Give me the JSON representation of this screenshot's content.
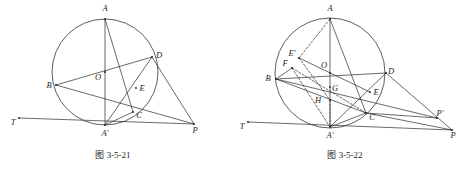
{
  "page": {
    "width": 469,
    "height": 170,
    "background": "#ffffff",
    "ink": "#2a2a2a"
  },
  "figures": [
    {
      "id": "fig-3-5-21",
      "caption": "图 3-5-21",
      "caption_pos": {
        "x": 113,
        "y": 158
      },
      "circle": {
        "cx": 105,
        "cy": 72,
        "r": 53
      },
      "points": {
        "A": {
          "x": 105,
          "y": 19,
          "label": "A",
          "lx": 105,
          "ly": 11
        },
        "B": {
          "x": 56,
          "y": 85,
          "label": "B",
          "lx": 49,
          "ly": 88
        },
        "O": {
          "x": 105,
          "y": 72,
          "label": "O",
          "lx": 98,
          "ly": 80
        },
        "D": {
          "x": 152,
          "y": 57,
          "label": "D",
          "lx": 159,
          "ly": 58
        },
        "E": {
          "x": 136,
          "y": 88,
          "label": "E",
          "lx": 142,
          "ly": 91
        },
        "C": {
          "x": 133,
          "y": 112,
          "label": "C",
          "lx": 139,
          "ly": 118
        },
        "Ap": {
          "x": 105,
          "y": 125,
          "label": "A'",
          "lx": 105,
          "ly": 136
        },
        "P": {
          "x": 194,
          "y": 124,
          "label": "P",
          "lx": 195,
          "ly": 133
        },
        "T": {
          "x": 19,
          "y": 118,
          "label": "T",
          "lx": 13,
          "ly": 125
        }
      },
      "segments": [
        {
          "name": "diameter-A-Aprime",
          "from": "A",
          "to": "Ap",
          "style": "solid"
        },
        {
          "name": "chord-B-D",
          "from": "B",
          "to": "D",
          "style": "solid"
        },
        {
          "name": "chord-A-C",
          "from": "A",
          "to": "C",
          "style": "solid"
        },
        {
          "name": "chord-Aprime-D",
          "from": "Ap",
          "to": "D",
          "style": "solid"
        },
        {
          "name": "segment-B-P",
          "from": "B",
          "to": "P",
          "style": "solid"
        },
        {
          "name": "segment-D-P",
          "from": "D",
          "to": "P",
          "style": "solid"
        },
        {
          "name": "tangent-T-P",
          "from": "T",
          "to": "P",
          "style": "solid"
        },
        {
          "name": "segment-Aprime-C",
          "from": "Ap",
          "to": "C",
          "style": "solid"
        }
      ]
    },
    {
      "id": "fig-3-5-22",
      "caption": "图 3-5-22",
      "caption_pos": {
        "x": 345,
        "y": 158
      },
      "circle": {
        "cx": 330,
        "cy": 73,
        "r": 55
      },
      "points": {
        "A": {
          "x": 330,
          "y": 19,
          "label": "A",
          "lx": 330,
          "ly": 11
        },
        "Ep": {
          "x": 299,
          "y": 58,
          "label": "E'",
          "lx": 292,
          "ly": 56
        },
        "F": {
          "x": 292,
          "y": 68,
          "label": "F",
          "lx": 285,
          "ly": 66
        },
        "B": {
          "x": 276,
          "y": 79,
          "label": "B",
          "lx": 268,
          "ly": 81
        },
        "O": {
          "x": 330,
          "y": 73,
          "label": "O",
          "lx": 324,
          "ly": 68
        },
        "D": {
          "x": 386,
          "y": 73,
          "label": "D",
          "lx": 391,
          "ly": 74
        },
        "G": {
          "x": 330,
          "y": 87,
          "label": "G",
          "lx": 335,
          "ly": 91
        },
        "H": {
          "x": 330,
          "y": 100,
          "label": "H",
          "lx": 318,
          "ly": 103
        },
        "E": {
          "x": 370,
          "y": 92,
          "label": "E",
          "lx": 376,
          "ly": 95
        },
        "C": {
          "x": 366,
          "y": 113,
          "label": "C",
          "lx": 372,
          "ly": 120
        },
        "Ap": {
          "x": 330,
          "y": 127,
          "label": "A'",
          "lx": 330,
          "ly": 138
        },
        "Pp": {
          "x": 437,
          "y": 118,
          "label": "P'",
          "lx": 440,
          "ly": 116
        },
        "P": {
          "x": 452,
          "y": 130,
          "label": "P",
          "lx": 453,
          "ly": 138
        },
        "T": {
          "x": 248,
          "y": 122,
          "label": "T",
          "lx": 242,
          "ly": 129
        }
      },
      "segments": [
        {
          "name": "diameter-A-Aprime",
          "from": "A",
          "to": "Ap",
          "style": "solid"
        },
        {
          "name": "diameter-B-D",
          "from": "B",
          "to": "D",
          "style": "solid"
        },
        {
          "name": "chord-A-C",
          "from": "A",
          "to": "C",
          "style": "solid"
        },
        {
          "name": "chord-Aprime-D",
          "from": "Ap",
          "to": "D",
          "style": "solid"
        },
        {
          "name": "chord-Aprime-C",
          "from": "Ap",
          "to": "C",
          "style": "solid"
        },
        {
          "name": "segment-B-Pprime",
          "from": "B",
          "to": "Pp",
          "style": "solid"
        },
        {
          "name": "segment-D-P",
          "from": "D",
          "to": "P",
          "style": "solid"
        },
        {
          "name": "segment-C-P",
          "from": "C",
          "to": "P",
          "style": "solid"
        },
        {
          "name": "segment-C-Pprime",
          "from": "C",
          "to": "Pp",
          "style": "solid"
        },
        {
          "name": "tangent-T-P",
          "from": "T",
          "to": "P",
          "style": "solid"
        },
        {
          "name": "segment-Eprime-E",
          "from": "Ep",
          "to": "E",
          "style": "solid"
        },
        {
          "name": "segment-B-C",
          "from": "B",
          "to": "C",
          "style": "solid"
        },
        {
          "name": "segment-A-Eprime",
          "from": "A",
          "to": "Ep",
          "style": "dashed"
        },
        {
          "name": "segment-F-C",
          "from": "F",
          "to": "C",
          "style": "dashed"
        },
        {
          "name": "segment-Eprime-H",
          "from": "Ep",
          "to": "H",
          "style": "dashed"
        },
        {
          "name": "segment-H-Aprime",
          "from": "H",
          "to": "Ap",
          "style": "dashed"
        },
        {
          "name": "segment-B-F",
          "from": "B",
          "to": "F",
          "style": "solid"
        },
        {
          "name": "segment-F-Aprime",
          "from": "F",
          "to": "Ap",
          "style": "dashed"
        }
      ]
    }
  ]
}
